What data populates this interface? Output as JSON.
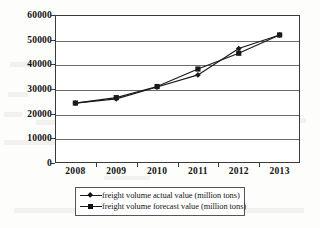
{
  "chart_data": {
    "type": "line",
    "title": "",
    "xlabel": "",
    "ylabel": "",
    "x": [
      "2008",
      "2009",
      "2010",
      "2011",
      "2012",
      "2013"
    ],
    "categories": [
      "2008",
      "2009",
      "2010",
      "2011",
      "2012",
      "2013"
    ],
    "series": [
      {
        "name": "freight volume actual value (million tons)",
        "marker": "diamond",
        "values": [
          24300,
          26000,
          30800,
          35700,
          46400,
          51900
        ]
      },
      {
        "name": "freight volume forecast value (million tons)",
        "marker": "square",
        "values": [
          24300,
          26500,
          31000,
          38100,
          44500,
          51900
        ]
      }
    ],
    "ylim": [
      0,
      60000
    ],
    "yticks": [
      "0",
      "10000",
      "20000",
      "30000",
      "40000",
      "50000",
      "60000"
    ],
    "ytick_values": [
      0,
      10000,
      20000,
      30000,
      40000,
      50000,
      60000
    ],
    "xticks": [
      "2008",
      "2009",
      "2010",
      "2011",
      "2012",
      "2013"
    ],
    "grid": "horizontal",
    "legend_position": "bottom",
    "line_color": "#1a1a1a",
    "frame_color": "#3a3a3a",
    "background": "#ffffff"
  },
  "legend": {
    "entries": [
      {
        "label": "freight volume actual value (million tons)",
        "marker": "diamond-marker"
      },
      {
        "label": "freight volume forecast value (million tons)",
        "marker": "square-marker"
      }
    ]
  }
}
